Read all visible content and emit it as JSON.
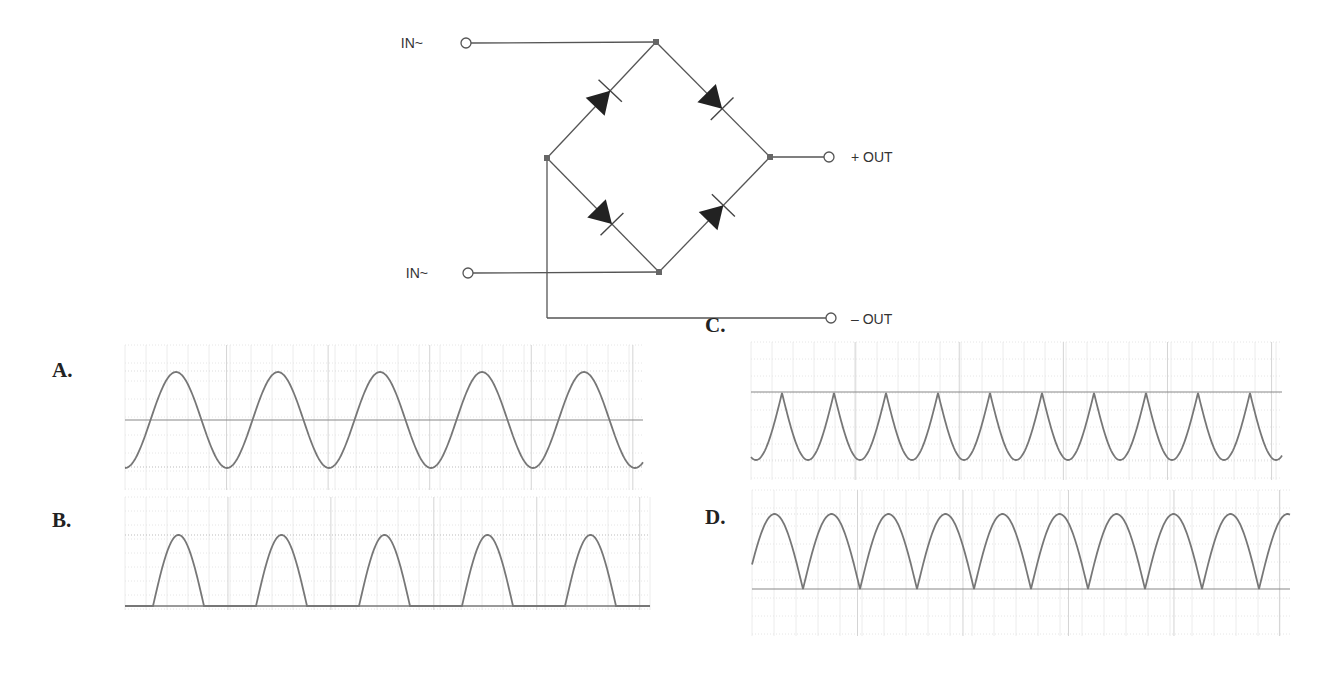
{
  "circuit": {
    "title": "Bridge rectifier",
    "terminals": {
      "in_top": "IN~",
      "in_bottom": "IN~",
      "out_pos": "+ OUT",
      "out_neg": "– OUT"
    },
    "nodes": {
      "top": [
        656,
        42
      ],
      "left": [
        547,
        158
      ],
      "right": [
        770,
        157
      ],
      "bottom": [
        659,
        272
      ]
    },
    "wire_color": "#555555",
    "diode_color": "#222222"
  },
  "options": [
    {
      "label": "A.",
      "description": "Full sine wave (AC input)"
    },
    {
      "label": "B.",
      "description": "Half-wave rectified"
    },
    {
      "label": "C.",
      "description": "Inverted full-wave rectified"
    },
    {
      "label": "D.",
      "description": "Full-wave rectified"
    }
  ],
  "chart_data": [
    {
      "type": "line",
      "title": "A.",
      "shape": "sine",
      "cycles": 4.7,
      "baseline": "midline",
      "grid": true,
      "box": [
        125,
        345,
        643,
        490
      ],
      "y_max_px": 371,
      "y_min_px": 467,
      "y_ref_px": 420,
      "x0_px": 125,
      "period_px": 102,
      "phase": "trough"
    },
    {
      "type": "line",
      "title": "B.",
      "shape": "half-wave",
      "pulses": 5,
      "grid": true,
      "box": [
        125,
        497,
        650,
        610
      ],
      "y_max_px": 535,
      "y_ref_px": 606,
      "x0_px": 153,
      "period_px": 103,
      "pulse_width_px": 51
    },
    {
      "type": "line",
      "title": "C.",
      "shape": "inverted full-wave",
      "cusps": 10,
      "grid": true,
      "box": [
        751,
        342,
        1282,
        480
      ],
      "y_max_px": 393,
      "y_min_px": 460,
      "y_ref_px": 392,
      "x0_px": 782,
      "period_px": 52
    },
    {
      "type": "line",
      "title": "D.",
      "shape": "full-wave",
      "humps": 9,
      "grid": true,
      "box": [
        752,
        490,
        1290,
        636
      ],
      "y_max_px": 514,
      "y_ref_px": 589,
      "x0_px": 803,
      "period_px": 57
    }
  ]
}
